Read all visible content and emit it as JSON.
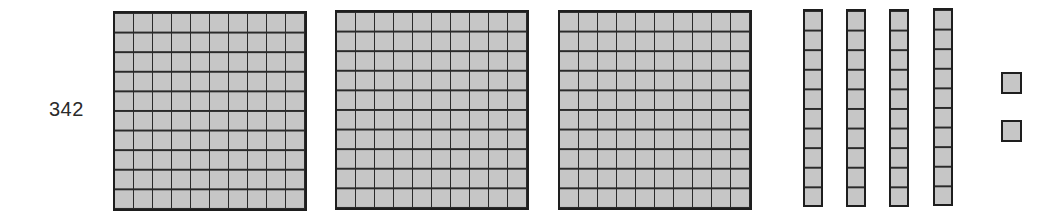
{
  "diagram": {
    "type": "base-ten-blocks",
    "number_label": "342",
    "value": 342,
    "colors": {
      "fill": "#c6c6c6",
      "stroke": "#1e1e1e",
      "label": "#2a2a2a",
      "background": "#ffffff"
    },
    "groups": {
      "hundreds": {
        "count": 3,
        "grid": "10x10"
      },
      "tens": {
        "count": 4,
        "grid": "1x10"
      },
      "ones": {
        "count": 2
      }
    }
  }
}
